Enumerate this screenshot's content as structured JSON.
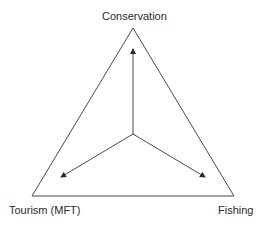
{
  "diagram": {
    "type": "triangle-tradeoff",
    "vertices": {
      "top": "Conservation",
      "left": "Tourism (MFT)",
      "right": "Fishing"
    },
    "arrows": [
      {
        "from": "center",
        "to": "Conservation"
      },
      {
        "from": "center",
        "to": "Tourism (MFT)"
      },
      {
        "from": "center",
        "to": "Fishing"
      }
    ],
    "colors": {
      "line": "#4a4a4a",
      "text": "#2a2a2a",
      "background": "#ffffff"
    }
  }
}
